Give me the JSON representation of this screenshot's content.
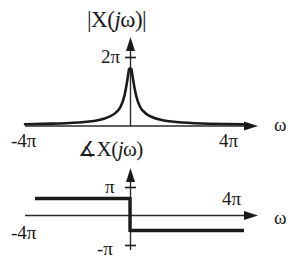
{
  "figure": {
    "background_color": "#ffffff",
    "ink_color": "#1a1a1a"
  },
  "magnitude_plot": {
    "title": "|X(jω)|",
    "title_parts": {
      "pre": "|X(",
      "j": "j",
      "post": "ω)|"
    },
    "y_tick_label": "2π",
    "x_left_label": "-4π",
    "x_right_label": "4π",
    "x_axis_label": "ω"
  },
  "phase_plot": {
    "title": "∡X(jω)",
    "title_parts": {
      "angle": "∡",
      "pre": "X(",
      "j": "j",
      "post": "ω)"
    },
    "y_top_label": "π",
    "y_bottom_label": "-π",
    "x_left_label": "-4π",
    "x_right_label": "4π",
    "x_axis_label": "ω"
  },
  "chart_data": [
    {
      "type": "line",
      "name": "magnitude",
      "title": "|X(jω)|",
      "xlabel": "ω",
      "ylabel": "|X(jω)|",
      "xlim": [
        -12.566,
        12.566
      ],
      "ylim": [
        0,
        6.9
      ],
      "xticks": [
        -12.566,
        12.566
      ],
      "xticklabels": [
        "-4π",
        "4π"
      ],
      "yticks": [
        6.283
      ],
      "yticklabels": [
        "2π"
      ],
      "grid": false,
      "legend": false,
      "function": "2/|omega| clipped at 2pi",
      "x": [
        -12.566,
        -11.0,
        -9.4,
        -7.85,
        -6.28,
        -4.71,
        -3.14,
        -2.2,
        -1.57,
        -1.1,
        -0.79,
        -0.55,
        -0.39,
        -0.25,
        -0.16,
        -0.08,
        0.08,
        0.16,
        0.25,
        0.39,
        0.55,
        0.79,
        1.1,
        1.57,
        2.2,
        3.14,
        4.71,
        6.28,
        7.85,
        9.4,
        11.0,
        12.566
      ],
      "y": [
        0.16,
        0.18,
        0.21,
        0.25,
        0.32,
        0.42,
        0.64,
        0.91,
        1.27,
        1.82,
        2.53,
        3.64,
        5.13,
        6.0,
        6.28,
        6.28,
        6.28,
        6.28,
        6.0,
        5.13,
        3.64,
        2.53,
        1.82,
        1.27,
        0.91,
        0.64,
        0.42,
        0.32,
        0.25,
        0.21,
        0.18,
        0.16
      ]
    },
    {
      "type": "line",
      "name": "phase",
      "title": "∡X(jω)",
      "xlabel": "ω",
      "ylabel": "∡X(jω)",
      "xlim": [
        -12.566,
        12.566
      ],
      "ylim": [
        -3.1416,
        3.1416
      ],
      "xticks": [
        -12.566,
        12.566
      ],
      "xticklabels": [
        "-4π",
        "4π"
      ],
      "yticks": [
        3.1416,
        -3.1416
      ],
      "yticklabels": [
        "π",
        "-π"
      ],
      "grid": false,
      "legend": false,
      "function": "pi for omega<0, -pi for omega>0",
      "segments": [
        {
          "x": [
            -12.566,
            0
          ],
          "y": [
            3.1416,
            3.1416
          ]
        },
        {
          "x": [
            0,
            0
          ],
          "y": [
            3.1416,
            -3.1416
          ]
        },
        {
          "x": [
            0,
            12.566
          ],
          "y": [
            -3.1416,
            -3.1416
          ]
        }
      ]
    }
  ]
}
